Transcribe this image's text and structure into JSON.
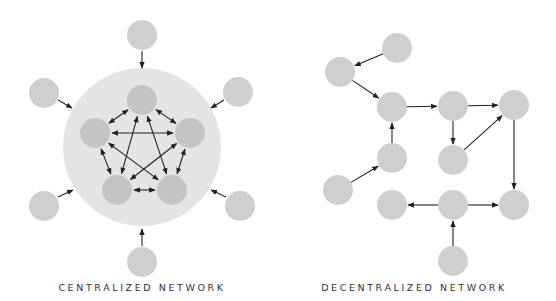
{
  "colors": {
    "background": "#ffffff",
    "node": "#cfcfcf",
    "inner_node": "#c4c4c4",
    "hub": "#e4e4e4",
    "edge": "#222222",
    "caption": "#333333"
  },
  "centralized": {
    "caption": "CENTRALIZED NETWORK",
    "hub": {
      "cx": 142,
      "cy": 147,
      "r": 79
    },
    "inner_nodes": [
      {
        "id": "c1",
        "cx": 142,
        "cy": 100
      },
      {
        "id": "c2",
        "cx": 95,
        "cy": 133
      },
      {
        "id": "c3",
        "cx": 190,
        "cy": 133
      },
      {
        "id": "c4",
        "cx": 117,
        "cy": 190
      },
      {
        "id": "c5",
        "cx": 172,
        "cy": 190
      }
    ],
    "outer_nodes": [
      {
        "id": "o1",
        "cx": 142,
        "cy": 35
      },
      {
        "id": "o2",
        "cx": 44,
        "cy": 93
      },
      {
        "id": "o3",
        "cx": 238,
        "cy": 92
      },
      {
        "id": "o4",
        "cx": 44,
        "cy": 206
      },
      {
        "id": "o5",
        "cx": 240,
        "cy": 206
      },
      {
        "id": "o6",
        "cx": 142,
        "cy": 262
      }
    ],
    "inner_edges_bidirectional": [
      [
        "c1",
        "c2"
      ],
      [
        "c1",
        "c3"
      ],
      [
        "c1",
        "c4"
      ],
      [
        "c1",
        "c5"
      ],
      [
        "c2",
        "c3"
      ],
      [
        "c2",
        "c4"
      ],
      [
        "c2",
        "c5"
      ],
      [
        "c3",
        "c4"
      ],
      [
        "c3",
        "c5"
      ],
      [
        "c4",
        "c5"
      ]
    ],
    "spoke_arrows": [
      {
        "from": [
          142,
          51
        ],
        "to": [
          142,
          68
        ]
      },
      {
        "from": [
          58,
          100
        ],
        "to": [
          72,
          108
        ]
      },
      {
        "from": [
          224,
          100
        ],
        "to": [
          211,
          108
        ]
      },
      {
        "from": [
          58,
          197
        ],
        "to": [
          73,
          190
        ]
      },
      {
        "from": [
          226,
          197
        ],
        "to": [
          211,
          190
        ]
      },
      {
        "from": [
          142,
          246
        ],
        "to": [
          142,
          229
        ]
      }
    ]
  },
  "decentralized": {
    "caption": "DECENTRALIZED NETWORK",
    "nodes": [
      {
        "id": "A",
        "cx": 397,
        "cy": 48
      },
      {
        "id": "B",
        "cx": 340,
        "cy": 72
      },
      {
        "id": "C",
        "cx": 392,
        "cy": 107
      },
      {
        "id": "D",
        "cx": 453,
        "cy": 106
      },
      {
        "id": "E",
        "cx": 514,
        "cy": 105
      },
      {
        "id": "F",
        "cx": 392,
        "cy": 158
      },
      {
        "id": "G",
        "cx": 453,
        "cy": 160
      },
      {
        "id": "H",
        "cx": 338,
        "cy": 190
      },
      {
        "id": "I",
        "cx": 392,
        "cy": 205
      },
      {
        "id": "J",
        "cx": 453,
        "cy": 205
      },
      {
        "id": "K",
        "cx": 514,
        "cy": 205
      },
      {
        "id": "L",
        "cx": 453,
        "cy": 261
      }
    ],
    "edges": [
      [
        "A",
        "B"
      ],
      [
        "B",
        "C"
      ],
      [
        "C",
        "D"
      ],
      [
        "D",
        "E"
      ],
      [
        "D",
        "G"
      ],
      [
        "G",
        "E"
      ],
      [
        "F",
        "C"
      ],
      [
        "H",
        "F"
      ],
      [
        "E",
        "K"
      ],
      [
        "J",
        "I"
      ],
      [
        "J",
        "K"
      ],
      [
        "L",
        "J"
      ]
    ]
  },
  "node_radius": 15
}
